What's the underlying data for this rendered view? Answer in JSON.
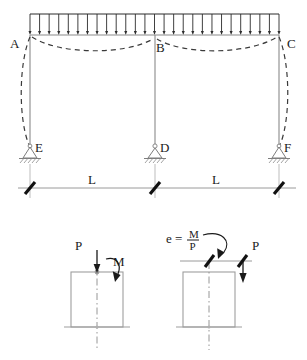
{
  "figure": {
    "top_diagram": {
      "name": "portal-frame-udl",
      "joint_labels": [
        {
          "id": "A",
          "text": "A",
          "x": 14,
          "y": 44
        },
        {
          "id": "B",
          "text": "B",
          "x": 155,
          "y": 50
        },
        {
          "id": "C",
          "text": "C",
          "x": 287,
          "y": 45
        },
        {
          "id": "E",
          "text": "E",
          "x": 40,
          "y": 150
        },
        {
          "id": "D",
          "text": "D",
          "x": 162,
          "y": 150
        },
        {
          "id": "F",
          "text": "F",
          "x": 285,
          "y": 150
        }
      ],
      "distributed_load": {
        "name": "uniform-distributed-load",
        "arrow_count": 27,
        "left_x": 30,
        "right_x": 279,
        "top_y": 14,
        "beam_y": 35,
        "direction": "down"
      },
      "beam": {
        "left_x": 30,
        "right_x": 279,
        "y": 35
      },
      "columns": [
        {
          "id": "AE",
          "x": 30,
          "top_y": 35,
          "bottom_y": 146
        },
        {
          "id": "BD",
          "x": 155,
          "top_y": 35,
          "bottom_y": 146
        },
        {
          "id": "CF",
          "x": 279,
          "top_y": 35,
          "bottom_y": 146
        }
      ],
      "supports": [
        {
          "id": "E",
          "type": "pinned",
          "x": 30,
          "y": 146
        },
        {
          "id": "D",
          "type": "pinned",
          "x": 155,
          "y": 146
        },
        {
          "id": "F",
          "type": "pinned",
          "x": 279,
          "y": 146
        }
      ],
      "deflected_shape": {
        "name": "deflected-shape-dashed",
        "style": "dashed",
        "description": "beam sags in both bays, outer columns bow outward"
      },
      "dimensions": {
        "name": "span-dimension-line",
        "y": 188,
        "labels": [
          {
            "text": "L",
            "x": 92,
            "y": 182
          },
          {
            "text": "L",
            "x": 216,
            "y": 182
          }
        ],
        "tick_positions": [
          30,
          155,
          279
        ]
      }
    },
    "detail_left": {
      "name": "detail-axial-plus-moment",
      "force_label": "P",
      "moment_label": "M",
      "force_label_pos": {
        "x": 79,
        "y": 248
      },
      "moment_label_pos": {
        "x": 116,
        "y": 264
      },
      "box": {
        "x": 71,
        "y": 272,
        "w": 52,
        "h": 55
      },
      "description": "Axial load P applied at centroid together with moment M"
    },
    "detail_right": {
      "name": "detail-eccentric-load",
      "equation": {
        "lhs": "e =",
        "numerator": "M",
        "denominator": "P"
      },
      "equation_pos": {
        "x": 166,
        "y": 240
      },
      "force_label": "P",
      "force_label_pos": {
        "x": 251,
        "y": 248
      },
      "box": {
        "x": 183,
        "y": 272,
        "w": 52,
        "h": 55
      },
      "eccentricity_line": {
        "y": 261,
        "left_x": 180,
        "right_x": 250
      },
      "description": "Equivalent single load P applied at eccentricity e = M/P"
    },
    "colors": {
      "frame_gray": "#8a8a8a",
      "ink_black": "#1a1a1a",
      "dash_gray": "#3a3a3a",
      "dim_gray": "#9a9a9a",
      "background": "#ffffff"
    }
  }
}
